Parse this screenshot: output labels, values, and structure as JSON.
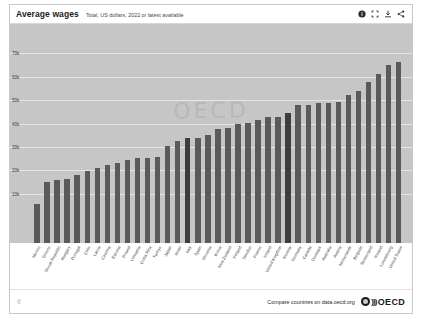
{
  "header": {
    "title": "Average wages",
    "subtitle": "Total, US dollars, 2022 or latest available",
    "icons": [
      {
        "name": "info-icon",
        "label": "Info"
      },
      {
        "name": "fullscreen-icon",
        "label": "Fullscreen"
      },
      {
        "name": "download-icon",
        "label": "Download"
      },
      {
        "name": "share-icon",
        "label": "Share"
      }
    ]
  },
  "watermark": "OECD",
  "footer": {
    "copyright": "©",
    "compare_text": "Compare countries on data.oecd.org",
    "brand": "OECD",
    "brand_waves": ")))"
  },
  "chart_data": {
    "type": "bar",
    "title": "Average wages",
    "subtitle": "Total, US dollars, 2022 or latest available",
    "xlabel": "",
    "ylabel": "",
    "ylim": [
      0,
      80000
    ],
    "grid": true,
    "legend": "none",
    "bar_color": "#5a5a5a",
    "highlight_color": "#3d3d3d",
    "ytick_labels": [
      "70k",
      "60k",
      "50k",
      "40k",
      "30k",
      "20k",
      "10k"
    ],
    "ytick_values": [
      70000,
      60000,
      50000,
      40000,
      30000,
      20000,
      10000
    ],
    "categories": [
      "Mexico",
      "Greece",
      "Slovak Republic",
      "Hungary",
      "Portugal",
      "Chile",
      "Latvia",
      "Czechia",
      "Estonia",
      "Poland",
      "Lithuania",
      "Costa Rica",
      "Turkiye",
      "Japan",
      "Israel",
      "Italy",
      "Spain",
      "Slovenia",
      "Korea",
      "New Zealand",
      "Finland",
      "Sweden",
      "France",
      "Ireland",
      "United Kingdom",
      "Norway",
      "Germany",
      "Canada",
      "Denmark",
      "Australia",
      "Austria",
      "Netherlands",
      "Belgium",
      "Switzerland",
      "Iceland",
      "Luxembourg",
      "United States"
    ],
    "values": [
      16685,
      25979,
      27092,
      27400,
      29268,
      30750,
      31970,
      33476,
      34270,
      35725,
      36230,
      36500,
      37000,
      41509,
      43500,
      44893,
      45130,
      46100,
      48922,
      49200,
      50777,
      51200,
      52764,
      53800,
      53985,
      55780,
      58940,
      59050,
      60000,
      60000,
      60300,
      63225,
      64850,
      69050,
      72500,
      76000,
      77463
    ],
    "highlight_indices": [
      15,
      25
    ]
  }
}
